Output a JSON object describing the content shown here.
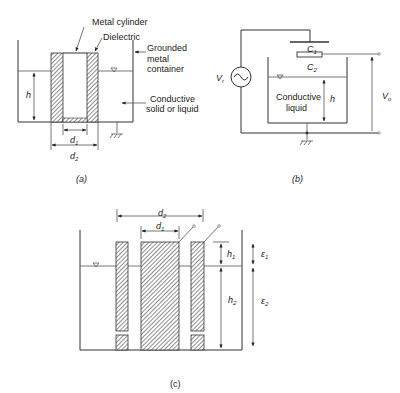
{
  "panel_a": {
    "caption": "(a)",
    "labels": {
      "metal_cylinder": "Metal cylinder",
      "dielectric": "Dielectric",
      "grounded_1": "Grounded",
      "grounded_2": "metal",
      "grounded_3": "container",
      "conductive_1": "Conductive",
      "conductive_2": "solid or liquid",
      "h": "h",
      "d1": "d",
      "d1_sub": "1",
      "d2": "d",
      "d2_sub": "2"
    }
  },
  "panel_b": {
    "caption": "(b)",
    "labels": {
      "vr": "V",
      "vr_sub": "r",
      "c1": "C",
      "c1_sub": "1",
      "c2": "C",
      "c2_sub": "2",
      "liquid_1": "Conductive",
      "liquid_2": "liquid",
      "h": "h",
      "vo": "V",
      "vo_sub": "o"
    }
  },
  "panel_c": {
    "caption": "(c)",
    "labels": {
      "d1": "d",
      "d1_sub": "1",
      "d2": "d",
      "d2_sub": "2",
      "h1": "h",
      "h1_sub": "1",
      "h2": "h",
      "h2_sub": "2",
      "e1": "ε",
      "e1_sub": "1",
      "e2": "ε",
      "e2_sub": "2"
    }
  }
}
